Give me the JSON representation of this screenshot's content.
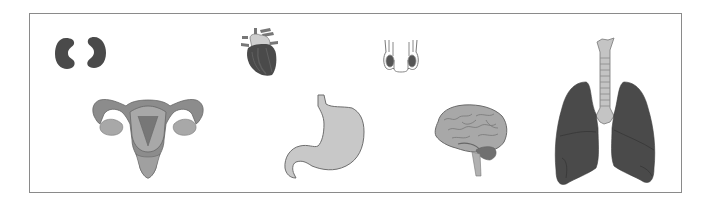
{
  "figure": {
    "border_color": "#8a8a8a",
    "background": "#ffffff",
    "organs": [
      {
        "name": "kidneys",
        "label": "kidneys-icon"
      },
      {
        "name": "heart",
        "label": "heart-icon"
      },
      {
        "name": "testes",
        "label": "testes-icon"
      },
      {
        "name": "uterus",
        "label": "uterus-icon"
      },
      {
        "name": "stomach",
        "label": "stomach-icon"
      },
      {
        "name": "brain",
        "label": "brain-icon"
      },
      {
        "name": "lungs",
        "label": "lungs-icon"
      }
    ],
    "colors": {
      "dark_organ": "#4a4a4a",
      "mid_organ": "#8c8c8c",
      "light_organ": "#c8c8c8",
      "outline": "#6e6e6e"
    }
  }
}
